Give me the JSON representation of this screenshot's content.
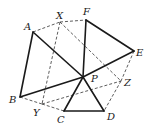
{
  "diagram": {
    "points": {
      "A": {
        "x": 33,
        "y": 32,
        "label": "A",
        "lx": 24,
        "ly": 30
      },
      "X": {
        "x": 60,
        "y": 22,
        "label": "X",
        "lx": 56,
        "ly": 19
      },
      "F": {
        "x": 86,
        "y": 20,
        "label": "F",
        "lx": 83,
        "ly": 15
      },
      "E": {
        "x": 134,
        "y": 51,
        "label": "E",
        "lx": 136,
        "ly": 56
      },
      "P": {
        "x": 83,
        "y": 77,
        "label": "P",
        "lx": 91,
        "ly": 82
      },
      "Z": {
        "x": 121,
        "y": 81,
        "label": "Z",
        "lx": 124,
        "ly": 86
      },
      "B": {
        "x": 20,
        "y": 97,
        "label": "B",
        "lx": 9,
        "ly": 103
      },
      "Y": {
        "x": 42,
        "y": 104,
        "label": "Y",
        "lx": 33,
        "ly": 116
      },
      "C": {
        "x": 64,
        "y": 111,
        "label": "C",
        "lx": 57,
        "ly": 123
      },
      "D": {
        "x": 104,
        "y": 111,
        "label": "D",
        "lx": 107,
        "ly": 120
      }
    },
    "solid_segments": [
      [
        "A",
        "B"
      ],
      [
        "A",
        "P"
      ],
      [
        "B",
        "P"
      ],
      [
        "F",
        "P"
      ],
      [
        "F",
        "E"
      ],
      [
        "E",
        "P"
      ],
      [
        "P",
        "C"
      ],
      [
        "P",
        "D"
      ],
      [
        "C",
        "D"
      ]
    ],
    "dashed_segments": [
      [
        "A",
        "X"
      ],
      [
        "X",
        "F"
      ],
      [
        "X",
        "Y"
      ],
      [
        "X",
        "Z"
      ],
      [
        "B",
        "Y"
      ],
      [
        "Y",
        "C"
      ],
      [
        "Y",
        "Z"
      ],
      [
        "E",
        "Z"
      ],
      [
        "Z",
        "D"
      ]
    ]
  }
}
